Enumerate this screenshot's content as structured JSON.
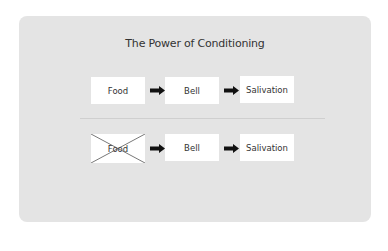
{
  "title": "The Power of Conditioning",
  "rows": [
    {
      "boxes": [
        {
          "label": "Food",
          "crossed": false
        },
        {
          "label": "Bell",
          "crossed": false
        },
        {
          "label": "Salivation",
          "crossed": false
        }
      ]
    },
    {
      "boxes": [
        {
          "label": "Food",
          "crossed": true
        },
        {
          "label": "Bell",
          "crossed": false
        },
        {
          "label": "Salivation",
          "crossed": false
        }
      ]
    }
  ],
  "colors": {
    "panel_bg": "#e4e4e4",
    "box_bg": "#ffffff",
    "arrow": "#111111",
    "text": "#333333"
  }
}
